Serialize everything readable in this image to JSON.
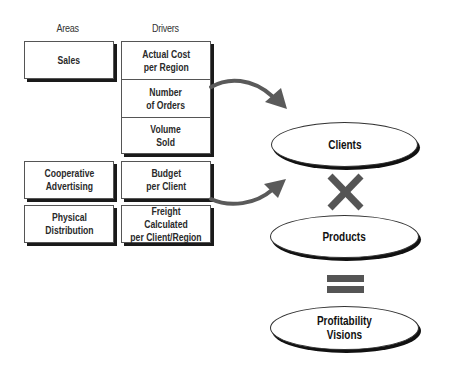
{
  "headers": {
    "areas": "Areas",
    "drivers": "Drivers"
  },
  "areas": [
    {
      "label": "Sales"
    },
    {
      "label": "Cooperative\nAdvertising"
    },
    {
      "label": "Physical\nDistribution"
    }
  ],
  "drivers": [
    {
      "label": "Actual Cost\nper Region"
    },
    {
      "label": "Number\nof Orders"
    },
    {
      "label": "Volume\nSold"
    },
    {
      "label": "Budget\nper Client"
    },
    {
      "label": "Freight Calculated\nper Client/Region"
    }
  ],
  "outcomes": [
    {
      "label": "Clients"
    },
    {
      "label": "Products"
    },
    {
      "label": "Profitability\nVisions"
    }
  ],
  "operators": {
    "multiply": "multiply-icon",
    "equals": "equals-icon"
  },
  "colors": {
    "arrow": "#5a5a5a",
    "operator": "#555555",
    "border": "#555555",
    "shadow": "#1a1a1a"
  }
}
